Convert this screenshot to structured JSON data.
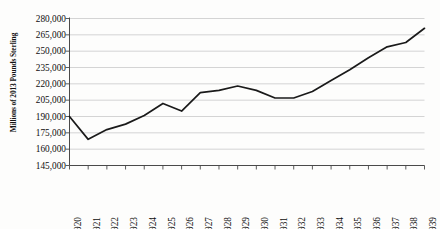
{
  "chart_data": {
    "type": "line",
    "title": "",
    "xlabel": "",
    "ylabel": "Millions of 2013 Pounds Sterling",
    "categories": [
      "1920",
      "1921",
      "1922",
      "1923",
      "1924",
      "1925",
      "1926",
      "1927",
      "1928",
      "1929",
      "1930",
      "1931",
      "1932",
      "1933",
      "1934",
      "1935",
      "1936",
      "1937",
      "1938",
      "1939"
    ],
    "values": [
      190000,
      169000,
      178000,
      183000,
      191000,
      202000,
      195000,
      212000,
      214000,
      218000,
      214000,
      207000,
      207000,
      213000,
      223000,
      233000,
      244000,
      254000,
      258000,
      271000
    ],
    "x": [
      1920,
      1921,
      1922,
      1923,
      1924,
      1925,
      1926,
      1927,
      1928,
      1929,
      1930,
      1931,
      1932,
      1933,
      1934,
      1935,
      1936,
      1937,
      1938,
      1939
    ],
    "ylim": [
      145000,
      280000
    ],
    "xlim": [
      1920,
      1939
    ],
    "yticks": [
      145000,
      160000,
      175000,
      190000,
      205000,
      220000,
      235000,
      250000,
      265000,
      280000
    ],
    "ytick_labels": [
      "145,000",
      "160,000",
      "175,000",
      "190,000",
      "205,000",
      "220,000",
      "235,000",
      "250,000",
      "265,000",
      "280,000"
    ],
    "xtick_labels": [
      "1920",
      "1921",
      "1922",
      "1923",
      "1924",
      "1925",
      "1926",
      "1927",
      "1928",
      "1929",
      "1930",
      "1931",
      "1932",
      "1933",
      "1934",
      "1935",
      "1936",
      "1937",
      "1938",
      "1939"
    ],
    "grid": "horizontal",
    "legend": "none",
    "series": [
      {
        "name": "",
        "values": [
          190000,
          169000,
          178000,
          183000,
          191000,
          202000,
          195000,
          212000,
          214000,
          218000,
          214000,
          207000,
          207000,
          213000,
          223000,
          233000,
          244000,
          254000,
          258000,
          271000
        ]
      }
    ],
    "colors": {
      "line": "#1a1a1a",
      "grid": "#c9c9c9",
      "axis": "#4a4a4a",
      "background": "#fdfdfc",
      "text": "#0d0d0d"
    }
  }
}
